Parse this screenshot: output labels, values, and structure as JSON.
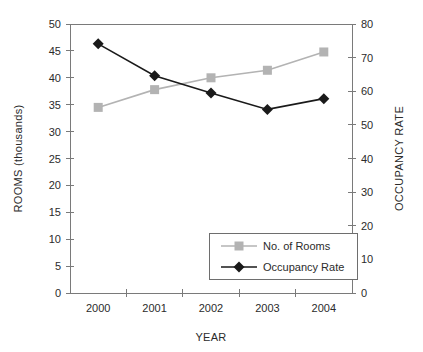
{
  "chart_data": {
    "type": "line",
    "title": "",
    "xlabel": "YEAR",
    "ylabel": "ROOMS (thousands)",
    "y2label": "OCCUPANCY RATE",
    "categories": [
      "2000",
      "2001",
      "2002",
      "2003",
      "2004"
    ],
    "grid": false,
    "legend_position": "inside-bottom-center",
    "ylim": [
      0,
      50
    ],
    "yticks": [
      0,
      5,
      10,
      15,
      20,
      25,
      30,
      35,
      40,
      45,
      50
    ],
    "ytick_labels": [
      "0",
      "5",
      "10",
      "15",
      "20",
      "25",
      "30",
      "35",
      "40",
      "45",
      "50"
    ],
    "y2lim": [
      0,
      80
    ],
    "y2ticks": [
      0,
      10,
      20,
      30,
      40,
      50,
      60,
      70,
      80
    ],
    "y2tick_labels": [
      "0",
      "10",
      "20",
      "30",
      "40",
      "50",
      "60",
      "70",
      "80"
    ],
    "series": [
      {
        "name": "No. of Rooms",
        "axis": "left",
        "color": "#b3b3b3",
        "marker": "square",
        "values": [
          34.5,
          37.8,
          40.0,
          41.4,
          44.8
        ]
      },
      {
        "name": "Occupancy Rate",
        "axis": "right",
        "color": "#1a1a1a",
        "marker": "diamond",
        "values": [
          74.1,
          64.6,
          59.5,
          54.6,
          57.8
        ]
      }
    ]
  },
  "legend": {
    "items": [
      {
        "label": "No. of Rooms",
        "color": "#b3b3b3",
        "marker": "square"
      },
      {
        "label": "Occupancy Rate",
        "color": "#1a1a1a",
        "marker": "diamond"
      }
    ]
  }
}
